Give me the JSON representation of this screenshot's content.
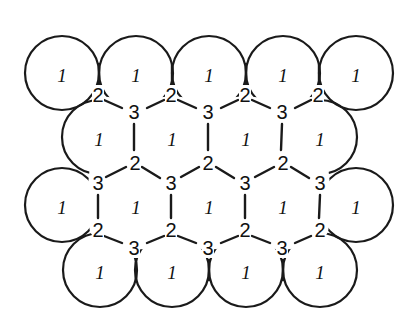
{
  "diagram": {
    "colors": {
      "line": "#1a1a1a",
      "background": "#ffffff"
    },
    "radius": 37,
    "rows": [
      {
        "name": "row-1",
        "circles": [
          [
            62,
            73
          ],
          [
            136,
            73
          ],
          [
            209,
            73
          ],
          [
            283,
            73
          ],
          [
            356,
            73
          ]
        ],
        "label": "1"
      },
      {
        "name": "row-2",
        "circles": [
          [
            99,
            137
          ],
          [
            172,
            137
          ],
          [
            246,
            137
          ],
          [
            320,
            137
          ]
        ],
        "label": "1"
      },
      {
        "name": "row-3",
        "circles": [
          [
            62,
            205
          ],
          [
            136,
            205
          ],
          [
            209,
            205
          ],
          [
            283,
            205
          ],
          [
            356,
            205
          ]
        ],
        "label": "1"
      },
      {
        "name": "row-4",
        "circles": [
          [
            100,
            270
          ],
          [
            172,
            270
          ],
          [
            246,
            270
          ],
          [
            320,
            270
          ]
        ],
        "label": "1"
      }
    ],
    "site_labels": {
      "sphere": "1",
      "site_b": "2",
      "site_c": "3"
    },
    "points_2": [
      [
        98,
        95
      ],
      [
        171,
        95
      ],
      [
        245,
        95
      ],
      [
        318,
        95
      ],
      [
        135,
        163
      ],
      [
        208,
        163
      ],
      [
        283,
        163
      ],
      [
        98,
        230
      ],
      [
        171,
        230
      ],
      [
        245,
        230
      ],
      [
        320,
        230
      ]
    ],
    "points_3": [
      [
        134,
        112
      ],
      [
        208,
        112
      ],
      [
        282,
        112
      ],
      [
        98,
        183
      ],
      [
        171,
        183
      ],
      [
        245,
        183
      ],
      [
        320,
        183
      ],
      [
        134,
        248
      ],
      [
        208,
        248
      ],
      [
        282,
        248
      ]
    ]
  }
}
